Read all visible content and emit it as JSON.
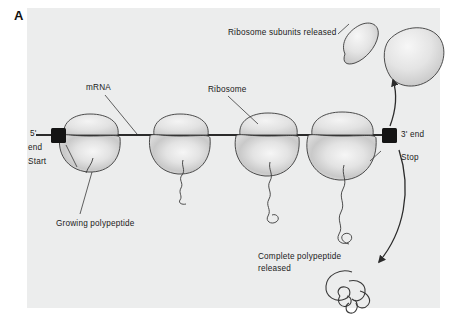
{
  "figure": {
    "panel_letter": "A",
    "background_color": "#eceded",
    "ink_color": "#2b2b2b"
  },
  "labels": {
    "mrna": "mRNA",
    "ribosome": "Ribosome",
    "five_prime_end_line1": "5'",
    "five_prime_end_line2": "end",
    "start": "Start",
    "three_prime_end": "3' end",
    "stop": "Stop",
    "growing_polypeptide": "Growing polypeptide",
    "subunits_released": "Ribosome subunits released",
    "complete_polypeptide_line1": "Complete polypeptide",
    "complete_polypeptide_line2": "released"
  },
  "elements": {
    "ribosome_count": 4,
    "released_subunit_small": "small-ribosomal-subunit",
    "released_subunit_large": "large-ribosomal-subunit",
    "start_codon_marker": "black-square",
    "stop_codon_marker": "black-square",
    "arrow_up": "subunit-release-arrow",
    "arrow_down": "polypeptide-release-arrow"
  }
}
